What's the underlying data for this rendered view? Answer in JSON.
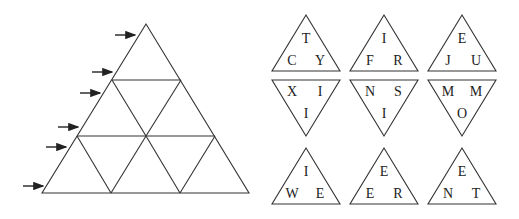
{
  "grid": {
    "description": "Large equilateral triangle divided into 9 small triangles (3 rows)",
    "rows": 3,
    "arrows_count": 6
  },
  "pieces": [
    {
      "orientation": "up",
      "top": "T",
      "left": "C",
      "right": "Y"
    },
    {
      "orientation": "up",
      "top": "I",
      "left": "F",
      "right": "R"
    },
    {
      "orientation": "up",
      "top": "E",
      "left": "J",
      "right": "U"
    },
    {
      "orientation": "down",
      "left": "X",
      "right": "I",
      "bottom": "I"
    },
    {
      "orientation": "down",
      "left": "N",
      "right": "S",
      "bottom": "I"
    },
    {
      "orientation": "down",
      "left": "M",
      "right": "M",
      "bottom": "O"
    },
    {
      "orientation": "up",
      "top": "I",
      "left": "W",
      "right": "E"
    },
    {
      "orientation": "up",
      "top": "E",
      "left": "E",
      "right": "R"
    },
    {
      "orientation": "up",
      "top": "E",
      "left": "N",
      "right": "T"
    }
  ]
}
